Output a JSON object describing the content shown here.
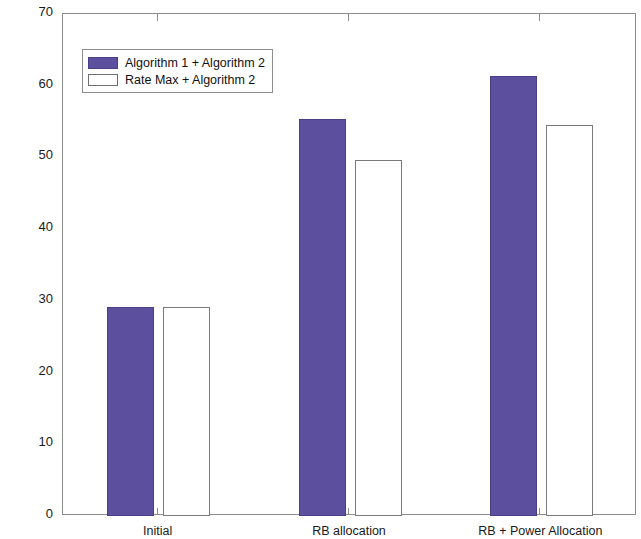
{
  "chart_data": {
    "type": "bar",
    "title": "",
    "xlabel": "",
    "ylabel": "Number of Users",
    "categories": [
      "Initial",
      "RB allocation",
      "RB + Power Allocation"
    ],
    "series": [
      {
        "name": "Algorithm 1 + Algorithm 2",
        "color": "#5b4f9e",
        "values": [
          29.2,
          55.4,
          61.3
        ]
      },
      {
        "name": "Rate Max + Algorithm 2",
        "color": "#ffffff",
        "values": [
          29.2,
          49.7,
          54.5
        ]
      }
    ],
    "ylim": [
      0,
      70
    ],
    "yticks": [
      0,
      10,
      20,
      30,
      40,
      50,
      60,
      70
    ],
    "ytick_labels": [
      "0",
      "10",
      "20",
      "30",
      "40",
      "50",
      "60",
      "70"
    ],
    "grid": false,
    "legend_position": "upper left",
    "box": true
  },
  "legend": {
    "entries": [
      {
        "label": "Algorithm 1 + Algorithm 2"
      },
      {
        "label": "Rate Max + Algorithm 2"
      }
    ]
  }
}
